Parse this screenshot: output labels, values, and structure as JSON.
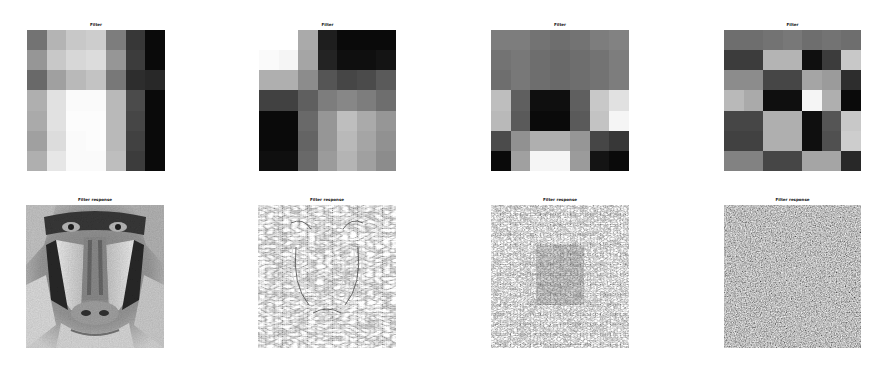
{
  "figure": {
    "top_row": [
      {
        "title": "Filter",
        "grid": [
          [
            115,
            180,
            200,
            205,
            125,
            55,
            10
          ],
          [
            150,
            200,
            215,
            220,
            150,
            60,
            10
          ],
          [
            105,
            160,
            185,
            195,
            120,
            45,
            40
          ],
          [
            175,
            225,
            250,
            250,
            185,
            75,
            10
          ],
          [
            170,
            225,
            252,
            252,
            185,
            70,
            10
          ],
          [
            160,
            220,
            250,
            252,
            185,
            65,
            10
          ],
          [
            175,
            230,
            250,
            250,
            190,
            60,
            10
          ]
        ]
      },
      {
        "title": "Filter",
        "grid": [
          [
            255,
            255,
            170,
            30,
            10,
            10,
            10
          ],
          [
            250,
            245,
            165,
            35,
            15,
            15,
            20
          ],
          [
            175,
            175,
            140,
            85,
            70,
            75,
            90
          ],
          [
            65,
            65,
            95,
            125,
            135,
            125,
            110
          ],
          [
            10,
            10,
            105,
            150,
            190,
            170,
            150
          ],
          [
            10,
            10,
            100,
            150,
            185,
            165,
            145
          ],
          [
            15,
            15,
            105,
            155,
            180,
            160,
            140
          ]
        ]
      },
      {
        "title": "Filter",
        "grid": [
          [
            125,
            125,
            115,
            110,
            115,
            125,
            130
          ],
          [
            115,
            120,
            110,
            105,
            110,
            115,
            125
          ],
          [
            110,
            120,
            110,
            105,
            110,
            115,
            125
          ],
          [
            190,
            95,
            15,
            15,
            95,
            200,
            225
          ],
          [
            185,
            90,
            10,
            10,
            90,
            195,
            245
          ],
          [
            75,
            145,
            175,
            175,
            150,
            70,
            55
          ],
          [
            10,
            160,
            245,
            245,
            155,
            20,
            10
          ]
        ]
      },
      {
        "title": "Filter",
        "grid": [
          [
            110,
            110,
            115,
            120,
            110,
            115,
            110
          ],
          [
            60,
            60,
            180,
            180,
            15,
            60,
            200
          ],
          [
            140,
            140,
            70,
            70,
            165,
            155,
            45
          ],
          [
            185,
            170,
            15,
            15,
            245,
            175,
            10
          ],
          [
            70,
            70,
            175,
            175,
            15,
            85,
            200
          ],
          [
            65,
            65,
            175,
            175,
            15,
            80,
            205
          ],
          [
            130,
            130,
            70,
            70,
            165,
            165,
            40
          ]
        ]
      }
    ],
    "bottom_row": [
      {
        "title": "Filter response",
        "image": "mandrill-face-grayscale"
      },
      {
        "title": "Filter response",
        "image": "mandrill-edge-response-strong"
      },
      {
        "title": "Filter response",
        "image": "mandrill-edge-response-medium"
      },
      {
        "title": "Filter response",
        "image": "mandrill-noise-response"
      }
    ]
  }
}
